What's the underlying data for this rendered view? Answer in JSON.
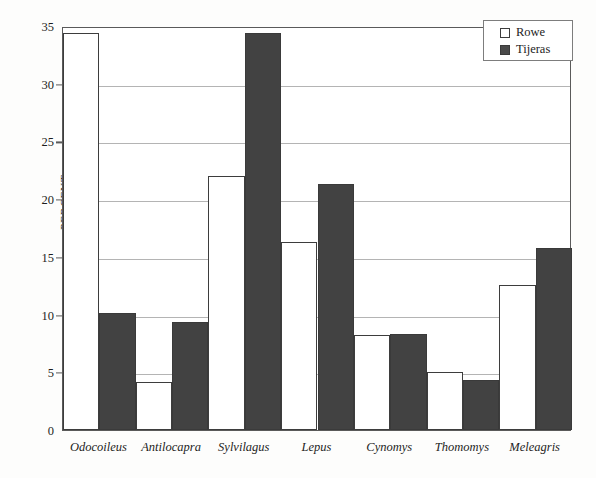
{
  "chart_data": {
    "type": "bar",
    "title": "",
    "xlabel": "",
    "ylabel": "PERCENT",
    "ylim": [
      0,
      35
    ],
    "yticks": [
      0,
      5,
      10,
      15,
      20,
      25,
      30,
      35
    ],
    "ytick_labels": [
      "0",
      "5",
      "10",
      "15",
      "20",
      "25",
      "30",
      "35"
    ],
    "grid": true,
    "legend_position": "top-right",
    "categories": [
      "Odocoileus",
      "Antilocapra",
      "Sylvilagus",
      "Lepus",
      "Cynomys",
      "Thomomys",
      "Meleagris"
    ],
    "series": [
      {
        "name": "Rowe",
        "color": "#ffffff",
        "values": [
          34.4,
          4.2,
          22.0,
          16.3,
          8.2,
          5.0,
          12.6
        ]
      },
      {
        "name": "Tijeras",
        "color": "#424242",
        "values": [
          10.1,
          9.4,
          34.4,
          21.3,
          8.3,
          4.3,
          15.8
        ]
      }
    ]
  },
  "legend": {
    "items": [
      {
        "label": "Rowe",
        "swatch": "open-square-swatch"
      },
      {
        "label": "Tijeras",
        "swatch": "filled-square-swatch"
      }
    ]
  },
  "axes": {
    "y_title": "PERCENT"
  }
}
